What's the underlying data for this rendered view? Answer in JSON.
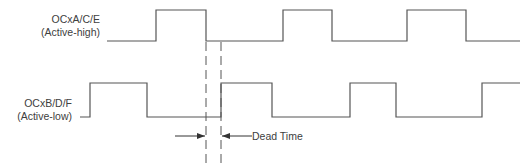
{
  "diagram": {
    "type": "timing-diagram",
    "signals": [
      {
        "name": "OCxA/C/E",
        "polarity": "(Active-high)",
        "low_y": 41,
        "high_y": 10,
        "points": "107,41 156,41 156,10 206,10 206,41 283,41 283,10 332,10 332,41 407,41 407,10 466,10 466,41 520,41"
      },
      {
        "name": "OCxB/D/F",
        "polarity": "(Active-low)",
        "low_y": 117,
        "high_y": 83,
        "points": "80,117 90,117 90,83 147,83 147,117 221,117 221,83 272,83 272,117 350,117 350,83 396,83 396,117 482,117 482,83 520,83"
      }
    ],
    "dead_time": {
      "label": "Dead Time",
      "x_start": 206,
      "x_end": 221
    },
    "colors": {
      "line": "#555555",
      "text": "#404040"
    }
  }
}
